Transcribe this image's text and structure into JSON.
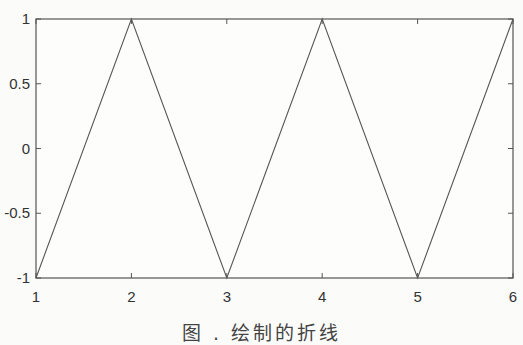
{
  "chart_data": {
    "type": "line",
    "title": "",
    "xlabel": "",
    "ylabel": "",
    "x": [
      1,
      2,
      3,
      4,
      5,
      6
    ],
    "series": [
      {
        "name": "zigzag",
        "values": [
          -1,
          1,
          -1,
          1,
          -1,
          1
        ],
        "color": "#555555"
      }
    ],
    "xlim": [
      1,
      6
    ],
    "ylim": [
      -1,
      1
    ],
    "xticks": [
      "1",
      "2",
      "3",
      "4",
      "5",
      "6"
    ],
    "yticks": [
      "1",
      "0.5",
      "0",
      "-0.5",
      "-1"
    ],
    "grid": false,
    "legend": null
  },
  "caption": "图 . 绘制的折线"
}
